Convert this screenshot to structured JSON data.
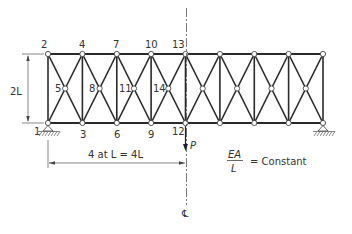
{
  "figure": {
    "type": "truss-diagram",
    "panels": 8,
    "node_labels": {
      "top": [
        "2",
        "4",
        "7",
        "10",
        "13"
      ],
      "mid": [
        "5",
        "8",
        "11",
        "14"
      ],
      "bottom": [
        "1",
        "3",
        "6",
        "9",
        "12"
      ]
    },
    "height_label": "2L",
    "span_label": "4 at L = 4L",
    "span_text_parts": {
      "count": "4",
      "at": "at",
      "L1": "L",
      "eq": "=",
      "val": "4L"
    },
    "load_label": "P",
    "property_label": {
      "numerator": "EA",
      "denominator": "L",
      "equals": "= Constant"
    },
    "centerline_symbol": "℄",
    "colors": {
      "line": "#2a2a2a",
      "text": "#333333",
      "background": "#ffffff"
    }
  }
}
